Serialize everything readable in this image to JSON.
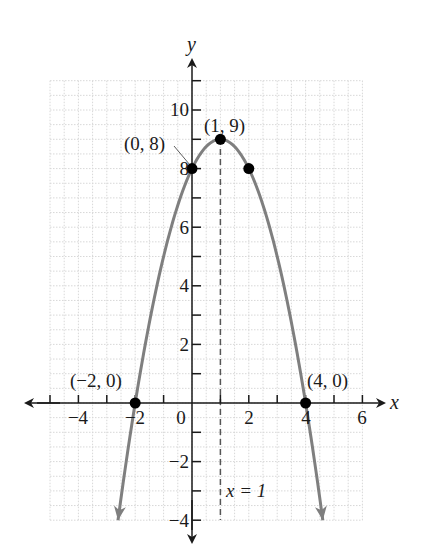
{
  "chart_data": {
    "type": "line",
    "title": "",
    "xlabel": "x",
    "ylabel": "y",
    "xlim": [
      -5,
      6
    ],
    "ylim": [
      -4,
      11
    ],
    "grid": true,
    "grid_step": 1,
    "function": "y = -(x - 1)^2 + 9",
    "x_tick_labels": [
      "-4",
      "-2",
      "0",
      "2",
      "4",
      "6"
    ],
    "y_tick_labels": [
      "-4",
      "-2",
      "2",
      "4",
      "6",
      "8",
      "10"
    ],
    "series": [
      {
        "name": "parabola",
        "x": [
          -2.606,
          -2,
          -1,
          0,
          1,
          2,
          3,
          4,
          4.606
        ],
        "y": [
          -4,
          0,
          5,
          8,
          9,
          8,
          5,
          0,
          -4
        ]
      }
    ],
    "points": [
      {
        "x": -2,
        "y": 0,
        "label": "(−2, 0)"
      },
      {
        "x": 0,
        "y": 8,
        "label": "(0, 8)"
      },
      {
        "x": 1,
        "y": 9,
        "label": "(1, 9)"
      },
      {
        "x": 2,
        "y": 8,
        "label": ""
      },
      {
        "x": 4,
        "y": 0,
        "label": "(4, 0)"
      }
    ],
    "annotations": [
      {
        "type": "vertical-dashed-line",
        "x": 1,
        "label": "x = 1"
      }
    ],
    "colors": {
      "curve": "#7f7f7f",
      "axis": "#1a1a1a",
      "grid": "#d8d8d8",
      "point": "#000000"
    }
  },
  "labels": {
    "x_axis": "x",
    "y_axis": "y",
    "ticks_x": {
      "m4": "−4",
      "m2": "−2",
      "zero": "0",
      "p2": "2",
      "p4": "4",
      "p6": "6"
    },
    "ticks_y": {
      "p10": "10",
      "p8": "8",
      "p6": "6",
      "p4": "4",
      "p2": "2",
      "m2": "−2",
      "m4": "−4"
    },
    "points": {
      "neg2_0": "(−2, 0)",
      "zero_8": "(0, 8)",
      "one_9": "(1, 9)",
      "four_0": "(4, 0)"
    },
    "axis_of_symmetry": "x = 1"
  }
}
